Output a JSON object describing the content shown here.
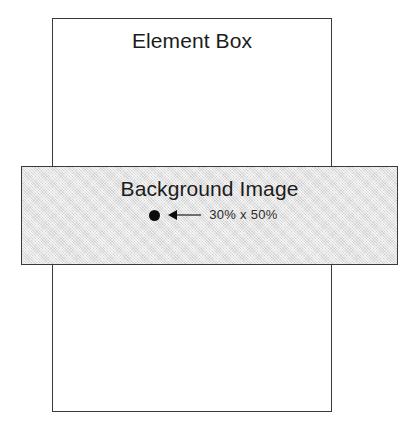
{
  "diagram": {
    "type": "css-background-sizing-illustration",
    "page_background": "#ffffff",
    "element_box": {
      "label": "Element Box",
      "fill_color": "#ffffff",
      "border_color": "#3a3a3a"
    },
    "background_image": {
      "label": "Background Image",
      "fill_color": "#dcdcdc",
      "border_color": "#3a3a3a",
      "annotation": {
        "size_label": "30% x 50%",
        "dot_icon": "filled-circle-icon",
        "arrow_icon": "arrowhead-left-icon",
        "leader_icon": "leader-line"
      }
    }
  }
}
